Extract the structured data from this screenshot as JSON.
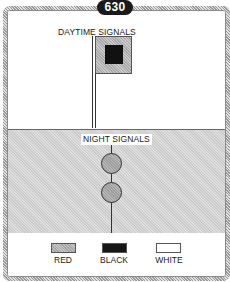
{
  "badge": {
    "number": "630"
  },
  "daytime": {
    "title": "DAYTIME SIGNALS",
    "signal": {
      "type": "flag",
      "outer_color": "red",
      "inner_color": "black",
      "shape": "square-on-square"
    }
  },
  "night": {
    "title": "NIGHT SIGNALS",
    "signal": {
      "type": "lights",
      "count": 2,
      "arrangement": "vertical",
      "colors": [
        "red",
        "red"
      ]
    }
  },
  "legend": {
    "items": [
      {
        "label": "RED",
        "color": "#b3b3b3",
        "pattern": "hatched-gray"
      },
      {
        "label": "BLACK",
        "color": "#151515",
        "pattern": "solid"
      },
      {
        "label": "WHITE",
        "color": "#ffffff",
        "pattern": "outline"
      }
    ]
  },
  "colors": {
    "frame_border": "#b9b9b9",
    "night_background": "#d4d4d4",
    "badge_background": "#1a1a1a",
    "badge_text": "#ffffff"
  }
}
